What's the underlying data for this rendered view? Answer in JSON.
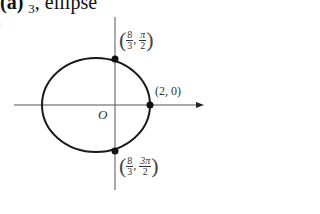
{
  "header": {
    "part_label": "(a)",
    "fraction_denominator": "3",
    "text": ", ellipse",
    "sub_label_partial": ")"
  },
  "diagram": {
    "origin_label": "O",
    "points": [
      {
        "name": "top",
        "x_num": "8",
        "x_den": "3",
        "theta_num": "π",
        "theta_den": "2"
      },
      {
        "name": "right",
        "label": "(2, 0)"
      },
      {
        "name": "bottom",
        "x_num": "8",
        "x_den": "3",
        "theta_num": "3π",
        "theta_den": "2"
      }
    ],
    "colors": {
      "curve": "#1a1a1a",
      "axis": "#555555"
    }
  }
}
